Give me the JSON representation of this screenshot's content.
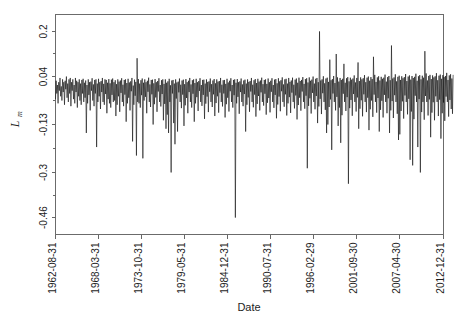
{
  "chart_data": {
    "type": "line",
    "title": "",
    "xlabel": "Date",
    "ylabel": "L_m",
    "ylabel_base": "L",
    "ylabel_sub": "m",
    "grid": false,
    "legend": false,
    "xtick_labels": [
      "1962-08-31",
      "1968-03-31",
      "1973-10-31",
      "1979-05-31",
      "1984-12-31",
      "1990-07-31",
      "1996-02-29",
      "2001-09-30",
      "2007-04-30",
      "2012-12-31"
    ],
    "ytick_labels": [
      "0.2",
      "0.04",
      "-0.13",
      "-0.3",
      "-0.46"
    ],
    "ytick_values": [
      0.2,
      0.04,
      -0.13,
      -0.3,
      -0.46
    ],
    "ylim": [
      -0.52,
      0.26
    ],
    "xlim": [
      0,
      604
    ],
    "series_name": "L_m",
    "series_color": "#101010",
    "x_index_of_ticks": [
      0,
      67,
      134,
      201,
      268,
      335,
      402,
      469,
      536,
      604
    ],
    "n_points": 605,
    "values": [
      -0.04,
      0.025,
      -0.02,
      0.01,
      -0.055,
      0.02,
      -0.01,
      0.035,
      -0.03,
      0.005,
      -0.045,
      0.03,
      -0.015,
      0.02,
      -0.06,
      0.025,
      -0.005,
      0.04,
      -0.035,
      0.015,
      -0.05,
      0.03,
      -0.02,
      0.035,
      -0.065,
      0.02,
      -0.01,
      0.03,
      -0.04,
      0.01,
      -0.055,
      0.035,
      -0.015,
      0.025,
      -0.07,
      0.02,
      -0.03,
      0.03,
      -0.045,
      0.015,
      -0.06,
      0.028,
      -0.02,
      0.032,
      -0.05,
      0.018,
      -0.035,
      0.026,
      -0.16,
      0.01,
      -0.055,
      0.03,
      -0.025,
      0.02,
      -0.08,
      0.022,
      -0.01,
      0.034,
      -0.045,
      0.012,
      -0.065,
      0.028,
      -0.02,
      0.03,
      -0.21,
      0.015,
      -0.05,
      0.032,
      -0.03,
      0.02,
      -0.075,
      0.024,
      -0.015,
      0.035,
      -0.05,
      0.014,
      -0.06,
      0.03,
      -0.022,
      0.028,
      -0.09,
      0.018,
      -0.04,
      0.031,
      -0.055,
      0.016,
      -0.07,
      0.029,
      -0.025,
      0.033,
      -0.05,
      0.02,
      -0.045,
      0.027,
      -0.1,
      0.013,
      -0.06,
      0.03,
      -0.03,
      0.022,
      -0.085,
      0.026,
      -0.018,
      0.034,
      -0.05,
      0.011,
      -0.065,
      0.028,
      -0.024,
      0.03,
      -0.12,
      0.017,
      -0.055,
      0.032,
      -0.035,
      0.019,
      -0.08,
      0.023,
      -0.012,
      0.035,
      -0.19,
      0.008,
      -0.06,
      0.029,
      -0.028,
      0.021,
      -0.24,
      0.105,
      -0.05,
      0.031,
      -0.055,
      0.015,
      -0.07,
      0.027,
      -0.026,
      0.033,
      -0.25,
      0.018,
      -0.045,
      0.03,
      -0.032,
      0.02,
      -0.09,
      0.025,
      -0.014,
      0.036,
      -0.05,
      0.012,
      -0.068,
      0.028,
      -0.023,
      0.029,
      -0.13,
      0.016,
      -0.058,
      0.031,
      -0.034,
      0.02,
      -0.085,
      0.024,
      -0.013,
      0.034,
      -0.05,
      0.01,
      -0.066,
      0.027,
      -0.022,
      0.03,
      -0.115,
      0.014,
      -0.057,
      0.03,
      -0.145,
      0.018,
      -0.095,
      0.023,
      -0.16,
      0.032,
      -0.05,
      0.009,
      -0.3,
      0.026,
      -0.02,
      0.028,
      -0.125,
      0.015,
      -0.2,
      0.03,
      -0.038,
      0.019,
      -0.155,
      0.022,
      -0.016,
      0.033,
      -0.05,
      0.011,
      -0.072,
      0.026,
      -0.024,
      0.029,
      -0.135,
      0.013,
      -0.062,
      0.031,
      -0.036,
      0.02,
      -0.09,
      0.025,
      -0.015,
      0.035,
      -0.05,
      0.012,
      -0.07,
      0.027,
      -0.021,
      0.03,
      -0.12,
      0.017,
      -0.055,
      0.032,
      -0.033,
      0.02,
      -0.082,
      0.024,
      -0.011,
      0.034,
      -0.05,
      0.01,
      -0.064,
      0.028,
      -0.025,
      0.029,
      -0.11,
      0.015,
      -0.056,
      0.03,
      -0.031,
      0.021,
      -0.086,
      0.023,
      -0.014,
      0.033,
      -0.05,
      0.013,
      -0.068,
      0.026,
      -0.023,
      0.031,
      -0.1,
      0.016,
      -0.054,
      0.03,
      -0.03,
      0.022,
      -0.088,
      0.024,
      -0.017,
      0.035,
      -0.05,
      0.011,
      -0.066,
      0.027,
      -0.02,
      0.028,
      -0.105,
      0.014,
      -0.058,
      0.032,
      -0.035,
      0.019,
      -0.084,
      0.025,
      -0.012,
      0.034,
      -0.05,
      0.01,
      -0.07,
      0.028,
      -0.026,
      0.03,
      -0.46,
      0.018,
      -0.055,
      0.031,
      -0.032,
      0.02,
      -0.092,
      0.023,
      -0.015,
      0.033,
      -0.05,
      0.012,
      -0.065,
      0.026,
      -0.022,
      0.029,
      -0.155,
      0.015,
      -0.06,
      0.03,
      -0.034,
      0.021,
      -0.085,
      0.024,
      -0.013,
      0.035,
      -0.05,
      0.011,
      -0.069,
      0.027,
      -0.024,
      0.031,
      -0.102,
      0.017,
      -0.057,
      0.032,
      -0.029,
      0.022,
      -0.08,
      0.026,
      -0.016,
      0.036,
      -0.05,
      0.013,
      -0.063,
      0.028,
      -0.021,
      0.03,
      -0.095,
      0.014,
      -0.053,
      0.033,
      -0.036,
      0.02,
      -0.087,
      0.025,
      -0.014,
      0.034,
      -0.05,
      0.01,
      -0.071,
      0.029,
      -0.025,
      0.031,
      -0.108,
      0.016,
      -0.059,
      0.034,
      -0.031,
      0.023,
      -0.083,
      0.027,
      -0.012,
      0.037,
      -0.05,
      0.012,
      -0.067,
      0.03,
      -0.023,
      0.032,
      -0.098,
      0.015,
      -0.055,
      0.035,
      -0.033,
      0.021,
      -0.089,
      0.026,
      -0.017,
      0.036,
      -0.05,
      0.011,
      -0.073,
      0.029,
      -0.027,
      0.033,
      -0.112,
      0.018,
      -0.061,
      0.036,
      -0.035,
      0.024,
      -0.081,
      0.028,
      -0.013,
      0.038,
      -0.05,
      0.014,
      -0.074,
      0.031,
      -0.028,
      0.034,
      -0.285,
      0.019,
      -0.064,
      0.037,
      -0.037,
      0.025,
      -0.091,
      0.029,
      -0.018,
      0.04,
      -0.05,
      0.015,
      -0.076,
      0.032,
      -0.029,
      0.035,
      -0.125,
      0.02,
      -0.066,
      0.2,
      -0.039,
      0.026,
      -0.093,
      0.03,
      -0.019,
      0.041,
      -0.05,
      0.016,
      -0.078,
      0.033,
      -0.16,
      0.036,
      -0.13,
      0.021,
      -0.068,
      0.1,
      -0.041,
      0.027,
      -0.22,
      0.031,
      -0.02,
      0.042,
      -0.05,
      0.017,
      -0.08,
      0.12,
      -0.032,
      0.037,
      -0.135,
      0.022,
      -0.07,
      0.035,
      -0.195,
      0.028,
      -0.097,
      0.032,
      -0.021,
      0.085,
      -0.05,
      0.018,
      -0.082,
      0.034,
      -0.033,
      0.038,
      -0.34,
      0.023,
      -0.072,
      0.036,
      -0.043,
      0.029,
      -0.099,
      0.033,
      -0.022,
      0.044,
      -0.05,
      0.019,
      -0.084,
      0.035,
      -0.034,
      0.09,
      -0.145,
      0.024,
      -0.074,
      0.037,
      -0.044,
      0.03,
      -0.101,
      0.034,
      -0.023,
      0.045,
      -0.05,
      0.02,
      -0.086,
      0.036,
      -0.035,
      0.04,
      -0.15,
      0.025,
      -0.076,
      0.038,
      -0.045,
      0.031,
      -0.103,
      0.11,
      -0.024,
      0.046,
      -0.05,
      0.021,
      -0.088,
      0.037,
      -0.036,
      0.041,
      -0.155,
      0.026,
      -0.078,
      0.039,
      -0.046,
      0.032,
      -0.105,
      0.036,
      -0.025,
      0.047,
      -0.05,
      0.022,
      -0.09,
      0.038,
      -0.037,
      0.042,
      -0.16,
      0.027,
      -0.08,
      0.15,
      -0.047,
      0.033,
      -0.107,
      0.037,
      -0.026,
      0.048,
      -0.05,
      0.023,
      -0.092,
      0.039,
      -0.185,
      0.043,
      -0.165,
      0.028,
      -0.082,
      0.041,
      -0.048,
      0.034,
      -0.109,
      0.038,
      -0.027,
      0.049,
      -0.05,
      0.024,
      -0.094,
      0.04,
      -0.039,
      0.044,
      -0.255,
      0.029,
      -0.084,
      0.042,
      -0.275,
      0.035,
      -0.111,
      0.039,
      -0.028,
      0.05,
      -0.05,
      0.025,
      -0.21,
      0.041,
      -0.04,
      0.045,
      -0.3,
      0.03,
      -0.086,
      0.043,
      -0.05,
      0.036,
      -0.113,
      0.13,
      -0.029,
      0.051,
      -0.05,
      0.026,
      -0.098,
      0.042,
      -0.041,
      0.046,
      -0.175,
      0.031,
      -0.088,
      0.044,
      -0.051,
      0.037,
      -0.115,
      0.041,
      -0.03,
      0.052,
      -0.05,
      0.027,
      -0.1,
      0.043,
      -0.042,
      0.047,
      -0.18,
      0.032,
      -0.09,
      0.045,
      -0.052,
      0.038,
      -0.117,
      0.042,
      -0.031,
      0.053,
      -0.05,
      0.028,
      -0.102,
      0.044,
      -0.043,
      0.048,
      -0.075,
      0.033,
      -0.092,
      0.046
    ]
  }
}
